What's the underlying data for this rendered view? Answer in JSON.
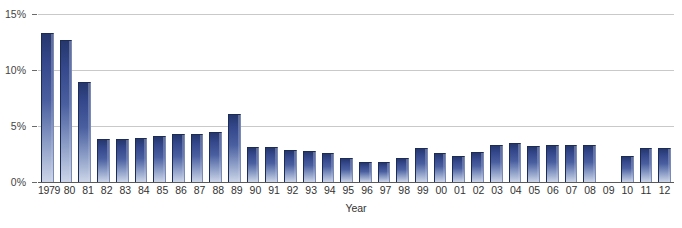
{
  "chart_data": {
    "type": "bar",
    "title": "",
    "xlabel": "Year",
    "ylabel": "",
    "ylim": [
      0,
      15
    ],
    "yticks": [
      0,
      5,
      10,
      15
    ],
    "ytick_labels": [
      "0%",
      "5%",
      "10%",
      "15%"
    ],
    "grid": true,
    "legend": "none",
    "categories": [
      "1979",
      "80",
      "81",
      "82",
      "83",
      "84",
      "85",
      "86",
      "87",
      "88",
      "89",
      "90",
      "91",
      "92",
      "93",
      "94",
      "95",
      "96",
      "97",
      "98",
      "99",
      "00",
      "01",
      "02",
      "03",
      "04",
      "05",
      "06",
      "07",
      "08",
      "09",
      "10",
      "11",
      "12"
    ],
    "values": [
      13.3,
      12.7,
      8.9,
      3.8,
      3.8,
      3.9,
      4.1,
      4.3,
      4.3,
      4.5,
      6.1,
      3.1,
      3.1,
      2.9,
      2.8,
      2.6,
      2.1,
      1.8,
      1.8,
      2.1,
      3.0,
      2.6,
      2.3,
      2.7,
      3.3,
      3.5,
      3.2,
      3.3,
      3.3,
      3.3,
      null,
      2.3,
      3.0,
      3.0
    ],
    "units": "percent",
    "missing_categories": [
      "09"
    ]
  },
  "colors": {
    "bar_top": "#26376d",
    "bar_bottom": "#ccd5e8",
    "gridline": "#c9c9c9",
    "baseline": "#5a5a5a",
    "text": "#333333"
  }
}
